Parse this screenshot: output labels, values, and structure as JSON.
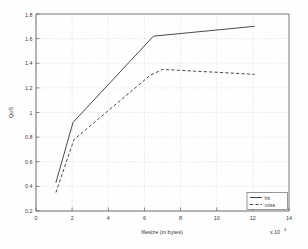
{
  "chart_data": {
    "type": "line",
    "title": "",
    "xlabel": "filesize (in bytes)",
    "ylabel": "QoS",
    "x_multiplier": "x 10",
    "x_multiplier_exponent": "4",
    "xlim": [
      0,
      14
    ],
    "ylim": [
      0.2,
      1.8
    ],
    "xticks": [
      0,
      2,
      4,
      6,
      8,
      10,
      12,
      14
    ],
    "xtick_labels": [
      "0",
      "2",
      "4",
      "6",
      "8",
      "10",
      "12",
      "14"
    ],
    "yticks": [
      0.2,
      0.4,
      0.6,
      0.8,
      1.0,
      1.2,
      1.4,
      1.6,
      1.8
    ],
    "ytick_labels": [
      "0.2",
      "0.4",
      "0.6",
      "0.8",
      "1",
      "1.2",
      "1.4",
      "1.6",
      "1.8"
    ],
    "grid": true,
    "grid_style": "dotted",
    "legend_position": "lower right",
    "series": [
      {
        "name": "hit",
        "style": "solid",
        "color": "#404040",
        "x": [
          1.1,
          2.05,
          6.5,
          12.1
        ],
        "y": [
          0.43,
          0.92,
          1.62,
          1.7
        ]
      },
      {
        "name": "miss",
        "style": "dashed",
        "color": "#404040",
        "x": [
          1.1,
          2.1,
          6.3,
          7.0,
          12.1
        ],
        "y": [
          0.35,
          0.78,
          1.3,
          1.35,
          1.31
        ]
      }
    ]
  },
  "legend": {
    "entries": [
      {
        "label": "hit",
        "style": "solid"
      },
      {
        "label": "miss",
        "style": "dashed"
      }
    ]
  },
  "colors": {
    "axis": "#555555",
    "grid": "#b8b8b8",
    "line": "#404040",
    "background": "#fefefe",
    "text": "#3a3a3a"
  }
}
